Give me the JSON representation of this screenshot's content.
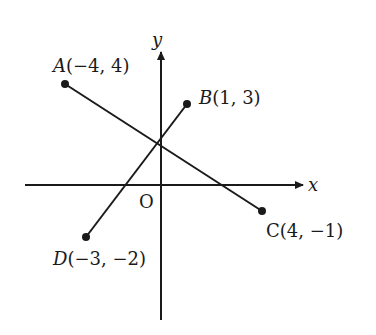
{
  "diagram": {
    "axes": {
      "x_label": "x",
      "y_label": "y",
      "origin_label": "O"
    },
    "points": [
      {
        "id": "A",
        "name": "A",
        "coords": "(−4, 4)",
        "x": -4,
        "y": 4
      },
      {
        "id": "B",
        "name": "B",
        "coords": "(1, 3)",
        "x": 1,
        "y": 3
      },
      {
        "id": "C",
        "name": "C",
        "coords": "(4, −1)",
        "x": 4,
        "y": -1
      },
      {
        "id": "D",
        "name": "D",
        "coords": "(−3, −2)",
        "x": -3,
        "y": -2
      }
    ],
    "segments": [
      {
        "from": "A",
        "to": "C"
      },
      {
        "from": "D",
        "to": "B"
      }
    ],
    "colors": {
      "ink": "#1a1a1a",
      "background": "#ffffff"
    }
  }
}
